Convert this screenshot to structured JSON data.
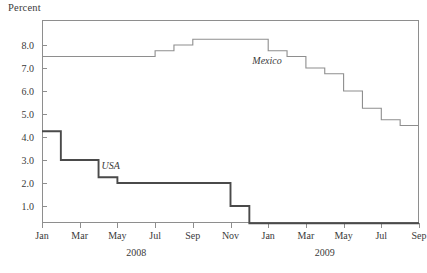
{
  "chart_data": {
    "type": "line",
    "title": "",
    "ylabel": "Percent",
    "xlabel": "",
    "ylim": [
      0.0,
      8.8
    ],
    "xlim": [
      "2008-01",
      "2009-09"
    ],
    "grid": false,
    "legend": "inline-annotations",
    "step_style": "post",
    "y_ticks": [
      "1.0",
      "2.0",
      "3.0",
      "4.0",
      "5.0",
      "6.0",
      "7.0",
      "8.0"
    ],
    "y_tick_values": [
      1.0,
      2.0,
      3.0,
      4.0,
      5.0,
      6.0,
      7.0,
      8.0
    ],
    "x_tick_labels": [
      "Jan",
      "Mar",
      "May",
      "Jul",
      "Sep",
      "Nov",
      "Jan",
      "Mar",
      "May",
      "Jul",
      "Sep"
    ],
    "x_tick_months": [
      "2008-01",
      "2008-03",
      "2008-05",
      "2008-07",
      "2008-09",
      "2008-11",
      "2009-01",
      "2009-03",
      "2009-05",
      "2009-07",
      "2009-09"
    ],
    "year_labels": [
      "2008",
      "2009"
    ],
    "year_positions": [
      "2008-06",
      "2009-04"
    ],
    "series": [
      {
        "name": "Mexico",
        "color": "#8e8e8e",
        "x": [
          "2008-01",
          "2008-02",
          "2008-03",
          "2008-04",
          "2008-05",
          "2008-06",
          "2008-07",
          "2008-08",
          "2008-09",
          "2008-10",
          "2008-11",
          "2008-12",
          "2009-01",
          "2009-02",
          "2009-03",
          "2009-04",
          "2009-05",
          "2009-06",
          "2009-07",
          "2009-08",
          "2009-09"
        ],
        "values": [
          7.5,
          7.5,
          7.5,
          7.5,
          7.5,
          7.5,
          7.75,
          8.0,
          8.25,
          8.25,
          8.25,
          8.25,
          7.75,
          7.5,
          7.0,
          6.75,
          6.0,
          5.25,
          4.75,
          4.5,
          4.5
        ]
      },
      {
        "name": "USA",
        "color": "#4a4a4a",
        "x": [
          "2008-01",
          "2008-02",
          "2008-03",
          "2008-04",
          "2008-05",
          "2008-06",
          "2008-07",
          "2008-08",
          "2008-09",
          "2008-10",
          "2008-11",
          "2008-12",
          "2009-01",
          "2009-02",
          "2009-03",
          "2009-04",
          "2009-05",
          "2009-06",
          "2009-07",
          "2009-08",
          "2009-09"
        ],
        "values": [
          4.25,
          3.0,
          3.0,
          2.25,
          2.0,
          2.0,
          2.0,
          2.0,
          2.0,
          2.0,
          1.0,
          0.25,
          0.25,
          0.25,
          0.25,
          0.25,
          0.25,
          0.25,
          0.25,
          0.25,
          0.25
        ]
      }
    ],
    "annotations": [
      {
        "text": "Mexico",
        "x": "2008-12",
        "y": 7.25
      },
      {
        "text": "USA",
        "x": "2008-04",
        "y": 2.7
      }
    ]
  }
}
